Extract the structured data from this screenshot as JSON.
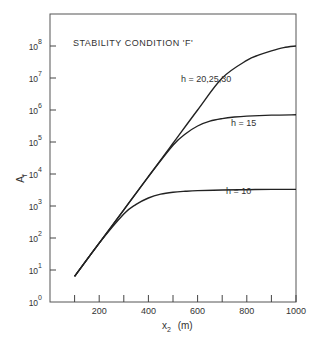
{
  "chart_data": {
    "type": "line",
    "title": "STABILITY CONDITION 'F'",
    "xlabel": "x2 (m)",
    "ylabel": "Af",
    "xlim": [
      0,
      1000
    ],
    "ylim_log10": [
      0,
      9
    ],
    "yscale": "log",
    "grid": false,
    "x_ticks": [
      100,
      200,
      300,
      400,
      500,
      600,
      700,
      800,
      900,
      1000
    ],
    "x_tick_labels": [
      {
        "value": 200,
        "label": "200"
      },
      {
        "value": 400,
        "label": "400"
      },
      {
        "value": 600,
        "label": "600"
      },
      {
        "value": 800,
        "label": "800"
      },
      {
        "value": 1000,
        "label": "1000"
      }
    ],
    "y_tick_labels": [
      {
        "exp": 0,
        "base": "10",
        "sup": "0"
      },
      {
        "exp": 1,
        "base": "10",
        "sup": "1"
      },
      {
        "exp": 2,
        "base": "10",
        "sup": "2"
      },
      {
        "exp": 3,
        "base": "10",
        "sup": "3"
      },
      {
        "exp": 4,
        "base": "10",
        "sup": "4"
      },
      {
        "exp": 5,
        "base": "10",
        "sup": "5"
      },
      {
        "exp": 6,
        "base": "10",
        "sup": "6"
      },
      {
        "exp": 7,
        "base": "10",
        "sup": "7"
      },
      {
        "exp": 8,
        "base": "10",
        "sup": "8"
      }
    ],
    "series": [
      {
        "name": "h = 20,25,30",
        "x": [
          100,
          200,
          300,
          400,
          500,
          600,
          700,
          800,
          850,
          900,
          950,
          1000
        ],
        "log10_y": [
          0.8,
          1.84,
          2.88,
          3.92,
          4.96,
          6.0,
          7.0,
          7.55,
          7.72,
          7.85,
          7.95,
          8.0
        ]
      },
      {
        "name": "h = 15",
        "x": [
          100,
          200,
          300,
          400,
          500,
          550,
          600,
          650,
          700,
          750,
          800,
          900,
          1000
        ],
        "log10_y": [
          0.8,
          1.84,
          2.88,
          3.92,
          4.9,
          5.25,
          5.5,
          5.65,
          5.73,
          5.78,
          5.81,
          5.84,
          5.85
        ]
      },
      {
        "name": "h = 10",
        "x": [
          100,
          200,
          300,
          350,
          400,
          450,
          500,
          550,
          600,
          700,
          800,
          900,
          1000
        ],
        "log10_y": [
          0.8,
          1.84,
          2.75,
          3.05,
          3.25,
          3.37,
          3.43,
          3.46,
          3.48,
          3.5,
          3.51,
          3.52,
          3.52
        ]
      }
    ],
    "annotations": [
      {
        "text": "STABILITY CONDITION 'F'",
        "px": 73,
        "py": 37
      },
      {
        "text": "h = 20,25,30",
        "px": 181,
        "py": 78
      },
      {
        "text": "h = 15",
        "px": 232,
        "py": 121
      },
      {
        "text": "h = 10",
        "px": 226,
        "py": 189
      }
    ]
  },
  "axis": {
    "ylabel_main": "A",
    "ylabel_sub": "f",
    "xlabel_main": "x",
    "xlabel_sub": "2",
    "xlabel_unit": "(m)"
  }
}
